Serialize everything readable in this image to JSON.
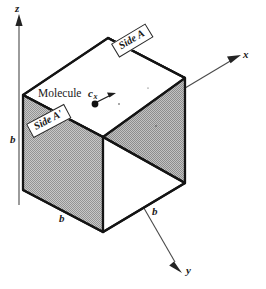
{
  "figure": {
    "kind": "isometric-cube-diagram",
    "caption_labels": {
      "molecule": "Molecule",
      "side_a": "Side A",
      "side_a_prime": "Side A'",
      "velocity_symbol": "c",
      "velocity_subscript": "x"
    },
    "axes": [
      {
        "name": "z-axis",
        "label": "z",
        "direction": "up"
      },
      {
        "name": "x-axis",
        "label": "x",
        "direction": "up-right"
      },
      {
        "name": "y-axis",
        "label": "y",
        "direction": "down-right"
      }
    ],
    "edge_labels": [
      {
        "name": "b-left-vertical",
        "label": "b"
      },
      {
        "name": "b-bottom-left",
        "label": "b"
      },
      {
        "name": "b-bottom-right",
        "label": "b"
      }
    ],
    "colors": {
      "stroke": "#1a1a1a",
      "shade_fill": "#a9a9a9",
      "shade_fill_light": "#b4b4b4",
      "background": "#ffffff",
      "axis_stroke": "#3a3a3a",
      "molecule_dot": "#111111"
    },
    "geometry": {
      "vertex_top": [
        108,
        38
      ],
      "vertex_left_top": [
        23,
        95
      ],
      "vertex_right_top": [
        185,
        78
      ],
      "vertex_center": [
        103,
        137
      ],
      "vertex_left_bottom": [
        23,
        190
      ],
      "vertex_right_bottom": [
        185,
        183
      ],
      "vertex_front_bottom": [
        103,
        232
      ],
      "molecule_dot": [
        95,
        104
      ]
    }
  }
}
